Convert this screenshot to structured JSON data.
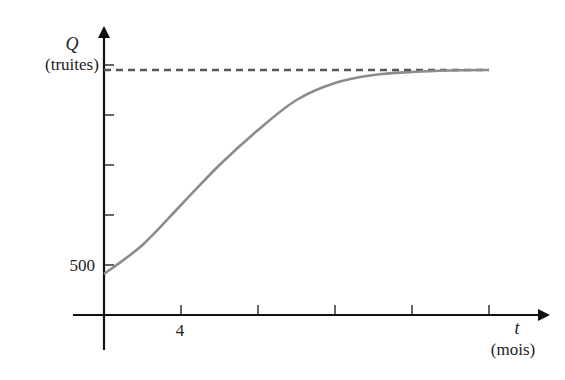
{
  "chart_data": {
    "type": "line",
    "title": "",
    "ylabel_symbol": "Q",
    "ylabel_unit": "(truites)",
    "xlabel_symbol": "t",
    "xlabel_unit": "(mois)",
    "x_tick_label": "4",
    "y_tick_label": "500",
    "x_ticks": [
      4,
      8,
      12,
      16,
      20
    ],
    "y_ticks": [
      500,
      1000,
      1500,
      2000,
      2500
    ],
    "xlim": [
      0,
      20
    ],
    "ylim": [
      0,
      2500
    ],
    "grid": false,
    "legend": "none",
    "asymptote": {
      "y": 2450,
      "style": "dashed",
      "color": "#555555"
    },
    "series": [
      {
        "name": "Q(t)",
        "color": "#8c8c8c",
        "x": [
          0,
          2,
          4,
          6,
          8,
          10,
          12,
          14,
          16,
          18,
          20
        ],
        "y": [
          410,
          700,
          1100,
          1500,
          1850,
          2150,
          2320,
          2400,
          2430,
          2445,
          2450
        ]
      }
    ]
  }
}
